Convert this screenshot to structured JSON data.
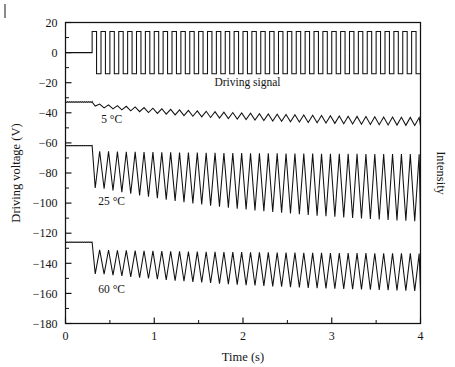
{
  "chart_data": {
    "type": "line",
    "title": "",
    "xlabel": "Time (s)",
    "ylabel": "Driving voltage (V)",
    "ylabel_right": "Intensity",
    "xlim": [
      0,
      4
    ],
    "ylim": [
      -180,
      20
    ],
    "xticks": [
      0,
      1,
      2,
      3,
      4
    ],
    "xticklabels": [
      "0",
      "1",
      "2",
      "3",
      "4"
    ],
    "xticks_minor": [
      0.5,
      1.5,
      2.5,
      3.5
    ],
    "yticks": [
      20,
      0,
      -20,
      -40,
      -60,
      -80,
      -100,
      -120,
      -140,
      -160,
      -180
    ],
    "yticklabels": [
      "20",
      "0",
      "−20",
      "−40",
      "−60",
      "−80",
      "−100",
      "−120",
      "−140",
      "−160",
      "−180"
    ],
    "grid": false,
    "legend": "none",
    "annotations": [
      {
        "text": "Driving signal",
        "x": 2.05,
        "y": -22.0,
        "name": "driving-signal-label"
      },
      {
        "text": "5 °C",
        "x": 0.52,
        "y": -47.0,
        "name": "temp-label-5c"
      },
      {
        "text": "25 °C",
        "x": 0.52,
        "y": -101.0,
        "name": "temp-label-25c"
      },
      {
        "text": "60 °C",
        "x": 0.52,
        "y": -160.0,
        "name": "temp-label-60c"
      }
    ],
    "drive_frequency_hz": 10,
    "signal_start_time": 0.3,
    "series": [
      {
        "name": "Driving signal",
        "kind": "square",
        "baseline": 0.0,
        "high": 14.0,
        "low": -14.0,
        "start": 0.3,
        "end": 4.0,
        "freq": 10,
        "duty": 0.5
      },
      {
        "name": "5 °C",
        "kind": "sawtooth",
        "baseline": -32.8,
        "start": 0.3,
        "end": 4.0,
        "freq": 10,
        "drop_to": -35.5,
        "top_start": -34.0,
        "top_end": -45.0,
        "bot_start": -36.5,
        "bot_end": -51.0,
        "settle": 0.55
      },
      {
        "name": "25 °C",
        "kind": "sawtooth",
        "baseline": -61.8,
        "start": 0.3,
        "end": 4.0,
        "freq": 10,
        "drop_to": -90.0,
        "top_start": -65.5,
        "top_end": -68.0,
        "bot_start": -90.0,
        "bot_end": -118.0,
        "settle": 0.62
      },
      {
        "name": "60 °C",
        "kind": "sawtooth",
        "baseline": -126.0,
        "start": 0.3,
        "end": 4.0,
        "freq": 10,
        "drop_to": -147.0,
        "top_start": -131.0,
        "top_end": -134.0,
        "bot_start": -147.0,
        "bot_end": -161.0,
        "settle": 0.58
      }
    ]
  }
}
